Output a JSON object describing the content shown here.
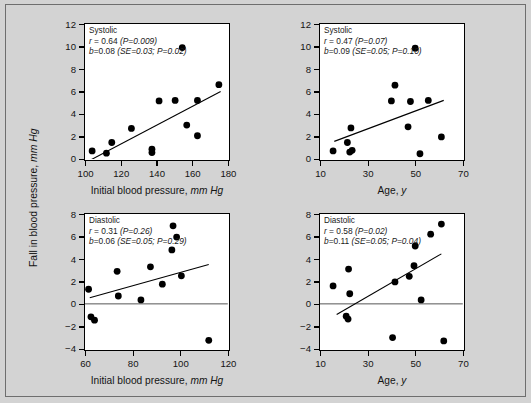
{
  "figure": {
    "background_color": "#d3d3d3",
    "frame_color": "#6e6e6e",
    "shared_y_axis_title": "Fall in blood pressure, mm Hg",
    "shared_y_axis_title_plain": "Fall in blood pressure,",
    "shared_y_axis_title_italic": "mm Hg"
  },
  "axis_titles": {
    "initial_bp_plain": "Initial blood pressure,",
    "initial_bp_italic": "mm Hg",
    "age_plain": "Age,",
    "age_italic": "y"
  },
  "chart_data": [
    {
      "id": "systolic-vs-initial-bp",
      "type": "scatter",
      "position": "top-left",
      "title": "Systolic",
      "xlabel": "Initial blood pressure, mm Hg",
      "ylabel": "Fall in blood pressure, mm Hg",
      "xlim": [
        100,
        180
      ],
      "ylim": [
        0,
        12
      ],
      "xticks": [
        100,
        120,
        140,
        160,
        180
      ],
      "yticks": [
        0,
        2,
        4,
        6,
        8,
        10,
        12
      ],
      "grid": false,
      "zero_line": false,
      "annotations": {
        "label": "Systolic",
        "r_line": "r = 0.64 (P=0.009)",
        "r_symbol": "r",
        "r_value": " = 0.64 ",
        "r_p": "(P=0.009)",
        "b_symbol": "b",
        "b_value": "=0.08 ",
        "b_paren": "(SE=0.03; P=0.02)",
        "b_line": "b=0.08 (SE=0.03; P=0.02)",
        "r": 0.64,
        "r_pvalue": 0.009,
        "b": 0.08,
        "b_se": 0.03,
        "b_pvalue": 0.02
      },
      "regression_line": {
        "x": [
          102,
          176
        ],
        "y": [
          -0.2,
          6.0
        ]
      },
      "points": [
        {
          "x": 104,
          "y": 0.7
        },
        {
          "x": 112,
          "y": 0.5
        },
        {
          "x": 115,
          "y": 1.45
        },
        {
          "x": 126,
          "y": 2.7
        },
        {
          "x": 137.5,
          "y": 0.55
        },
        {
          "x": 137.5,
          "y": 0.85
        },
        {
          "x": 141.5,
          "y": 5.15
        },
        {
          "x": 150.5,
          "y": 5.2
        },
        {
          "x": 154.5,
          "y": 9.9
        },
        {
          "x": 157,
          "y": 3.0
        },
        {
          "x": 163,
          "y": 2.05
        },
        {
          "x": 163,
          "y": 5.2
        },
        {
          "x": 175,
          "y": 6.6
        }
      ]
    },
    {
      "id": "systolic-vs-age",
      "type": "scatter",
      "position": "top-right",
      "title": "Systolic",
      "xlabel": "Age, y",
      "ylabel": "Fall in blood pressure, mm Hg",
      "xlim": [
        10,
        70
      ],
      "ylim": [
        0,
        12
      ],
      "xticks": [
        10,
        30,
        50,
        70
      ],
      "yticks": [
        0,
        2,
        4,
        6,
        8,
        10,
        12
      ],
      "grid": false,
      "zero_line": false,
      "annotations": {
        "label": "Systolic",
        "r_line": "r = 0.47 (P=0.07)",
        "r_symbol": "r",
        "r_value": " = 0.47 ",
        "r_p": "(P=0.07)",
        "b_symbol": "b",
        "b_value": "=0.09 ",
        "b_paren": "(SE=0.05; P=0.10)",
        "b_line": "b=0.09 (SE=0.05; P=0.10)",
        "r": 0.47,
        "r_pvalue": 0.07,
        "b": 0.09,
        "b_se": 0.05,
        "b_pvalue": 0.1
      },
      "regression_line": {
        "x": [
          16,
          62
        ],
        "y": [
          1.55,
          5.2
        ]
      },
      "points": [
        {
          "x": 15.5,
          "y": 0.7
        },
        {
          "x": 21.5,
          "y": 1.45
        },
        {
          "x": 22.5,
          "y": 0.6
        },
        {
          "x": 23.5,
          "y": 0.75
        },
        {
          "x": 23,
          "y": 2.75
        },
        {
          "x": 40,
          "y": 5.15
        },
        {
          "x": 41.5,
          "y": 6.55
        },
        {
          "x": 47,
          "y": 2.85
        },
        {
          "x": 48,
          "y": 5.1
        },
        {
          "x": 50,
          "y": 9.85
        },
        {
          "x": 52,
          "y": 0.45
        },
        {
          "x": 55.5,
          "y": 5.2
        },
        {
          "x": 61,
          "y": 1.95
        }
      ]
    },
    {
      "id": "diastolic-vs-initial-bp",
      "type": "scatter",
      "position": "bottom-left",
      "title": "Diastolic",
      "xlabel": "Initial blood pressure, mm Hg",
      "ylabel": "Fall in blood pressure, mm Hg",
      "xlim": [
        60,
        120
      ],
      "ylim": [
        -4,
        8
      ],
      "xticks": [
        60,
        80,
        100,
        120
      ],
      "yticks": [
        -4,
        -2,
        0,
        2,
        4,
        6,
        8
      ],
      "grid": false,
      "zero_line": true,
      "annotations": {
        "label": "Diastolic",
        "r_line": "r = 0.31 (P=0.26)",
        "r_symbol": "r",
        "r_value": " = 0.31 ",
        "r_p": "(P=0.26)",
        "b_symbol": "b",
        "b_value": "=0.06 ",
        "b_paren": "(SE=0.05; P=0.29)",
        "b_line": "b=0.06 (SE=0.05; P=0.29)",
        "r": 0.31,
        "r_pvalue": 0.26,
        "b": 0.06,
        "b_se": 0.05,
        "b_pvalue": 0.29
      },
      "regression_line": {
        "x": [
          62,
          112
        ],
        "y": [
          0.55,
          3.5
        ]
      },
      "points": [
        {
          "x": 61.5,
          "y": 1.3
        },
        {
          "x": 62.5,
          "y": -1.15
        },
        {
          "x": 64,
          "y": -1.45
        },
        {
          "x": 73.5,
          "y": 2.9
        },
        {
          "x": 74,
          "y": 0.7
        },
        {
          "x": 83.5,
          "y": 0.35
        },
        {
          "x": 87.5,
          "y": 3.3
        },
        {
          "x": 92.5,
          "y": 1.75
        },
        {
          "x": 96.5,
          "y": 4.8
        },
        {
          "x": 97,
          "y": 6.95
        },
        {
          "x": 98.5,
          "y": 5.95
        },
        {
          "x": 100.5,
          "y": 2.5
        },
        {
          "x": 112,
          "y": -3.25
        }
      ]
    },
    {
      "id": "diastolic-vs-age",
      "type": "scatter",
      "position": "bottom-right",
      "title": "Diastolic",
      "xlabel": "Age, y",
      "ylabel": "Fall in blood pressure, mm Hg",
      "xlim": [
        10,
        70
      ],
      "ylim": [
        -4,
        8
      ],
      "xticks": [
        10,
        30,
        50,
        70
      ],
      "yticks": [
        -4,
        -2,
        0,
        2,
        4,
        6,
        8
      ],
      "grid": false,
      "zero_line": true,
      "annotations": {
        "label": "Diastolic",
        "r_line": "r = 0.58 (P=0.02)",
        "r_symbol": "r",
        "r_value": " = 0.58 ",
        "r_p": "(P=0.02)",
        "b_symbol": "b",
        "b_value": "=0.11 ",
        "b_paren": "(SE=0.05; P=0.04)",
        "b_line": "b=0.11 (SE=0.05; P=0.04)",
        "r": 0.58,
        "r_pvalue": 0.02,
        "b": 0.11,
        "b_se": 0.05,
        "b_pvalue": 0.04
      },
      "regression_line": {
        "x": [
          17,
          61
        ],
        "y": [
          -0.95,
          4.45
        ]
      },
      "points": [
        {
          "x": 15.5,
          "y": 1.6
        },
        {
          "x": 21,
          "y": -1.1
        },
        {
          "x": 21.8,
          "y": -1.35
        },
        {
          "x": 22,
          "y": 3.1
        },
        {
          "x": 22.5,
          "y": 0.9
        },
        {
          "x": 40.5,
          "y": -3.0
        },
        {
          "x": 41.5,
          "y": 1.95
        },
        {
          "x": 47.5,
          "y": 2.45
        },
        {
          "x": 49.5,
          "y": 3.4
        },
        {
          "x": 50,
          "y": 5.15
        },
        {
          "x": 52.5,
          "y": 0.35
        },
        {
          "x": 56.5,
          "y": 6.2
        },
        {
          "x": 61,
          "y": 7.1
        },
        {
          "x": 62,
          "y": -3.3
        }
      ]
    }
  ]
}
